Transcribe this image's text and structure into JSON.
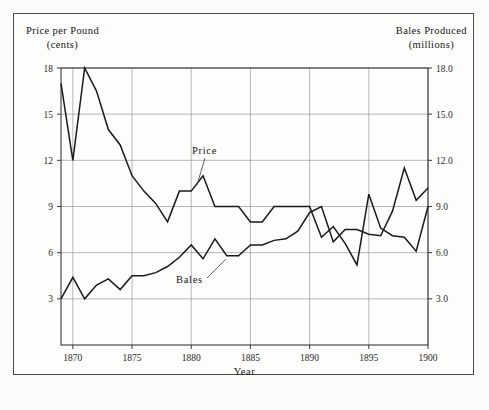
{
  "figure": {
    "background": "#fbfbf9",
    "frame_color": "#4a4a4a",
    "line_color": "#1a1a1a",
    "grid_color": "#9a9a9a"
  },
  "left_axis": {
    "title": "Price per Pound",
    "unit": "(cents)",
    "ticks": [
      "18",
      "15",
      "12",
      "9",
      "6",
      "3"
    ]
  },
  "right_axis": {
    "title": "Bales  Produced",
    "unit": "(millions)",
    "ticks": [
      "18.0",
      "15.0",
      "12.0",
      "9.0",
      "6.0",
      "3.0"
    ]
  },
  "x_axis": {
    "title": "Year",
    "ticks": [
      "1870",
      "1875",
      "1880",
      "1885",
      "1890",
      "1895",
      "1900"
    ]
  },
  "annotations": {
    "price_label": "Price",
    "bales_label": "Bales"
  },
  "chart_data": {
    "type": "line",
    "title": "",
    "xlabel": "Year",
    "ylabel": "Price per Pound (cents)",
    "y2label": "Bales Produced (millions)",
    "grid": true,
    "legend": "inline-annotations",
    "xlim": [
      1869,
      1900
    ],
    "ylim": [
      0,
      18
    ],
    "y2lim": [
      0,
      18
    ],
    "yticks": [
      3,
      6,
      9,
      12,
      15,
      18
    ],
    "y2ticks": [
      3.0,
      6.0,
      9.0,
      12.0,
      15.0,
      18.0
    ],
    "xticks": [
      1870,
      1875,
      1880,
      1885,
      1890,
      1895,
      1900
    ],
    "x": [
      1869,
      1870,
      1871,
      1872,
      1873,
      1874,
      1875,
      1876,
      1877,
      1878,
      1879,
      1880,
      1881,
      1882,
      1883,
      1884,
      1885,
      1886,
      1887,
      1888,
      1889,
      1890,
      1891,
      1892,
      1893,
      1894,
      1895,
      1896,
      1897,
      1898,
      1899,
      1900
    ],
    "series": [
      {
        "name": "Price",
        "axis": "left",
        "unit": "cents per pound",
        "values": [
          17.0,
          12.0,
          18.0,
          16.5,
          14.0,
          13.0,
          11.0,
          10.0,
          9.2,
          8.0,
          10.0,
          10.0,
          11.0,
          9.0,
          9.0,
          9.0,
          8.0,
          8.0,
          9.0,
          9.0,
          9.0,
          9.0,
          7.0,
          7.7,
          6.6,
          5.2,
          9.8,
          7.6,
          7.1,
          7.0,
          6.1,
          9.0
        ]
      },
      {
        "name": "Bales",
        "axis": "right",
        "unit": "millions of bales",
        "values": [
          3.0,
          4.4,
          3.0,
          3.9,
          4.3,
          3.6,
          4.5,
          4.5,
          4.7,
          5.1,
          5.7,
          6.5,
          5.6,
          6.9,
          5.8,
          5.8,
          6.5,
          6.5,
          6.8,
          6.9,
          7.4,
          8.6,
          9.0,
          6.7,
          7.5,
          7.5,
          7.2,
          7.1,
          8.7,
          11.5,
          9.4,
          10.2
        ]
      }
    ]
  }
}
